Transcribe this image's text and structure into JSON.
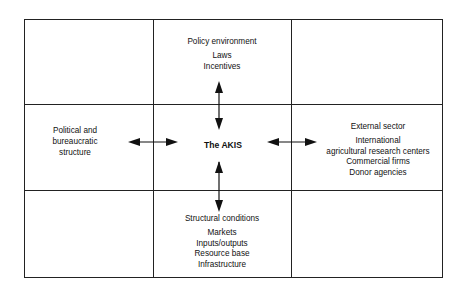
{
  "diagram": {
    "center": {
      "label": "The AKIS"
    },
    "top": {
      "title": "Policy environment",
      "items": [
        "Laws",
        "Incentives"
      ]
    },
    "left": {
      "lines": [
        "Political and",
        "bureaucratic",
        "structure"
      ]
    },
    "right": {
      "title": "External sector",
      "items": [
        "International",
        "agricultural research centers",
        "Commercial firms",
        "Donor agencies"
      ]
    },
    "bottom": {
      "title": "Structural conditions",
      "items": [
        "Markets",
        "Inputs/outputs",
        "Resource base",
        "Infrastructure"
      ]
    },
    "connections": [
      {
        "from": "The AKIS",
        "to": "Policy environment",
        "type": "bidirectional-arrow"
      },
      {
        "from": "The AKIS",
        "to": "Political and bureaucratic structure",
        "type": "bidirectional-arrow"
      },
      {
        "from": "The AKIS",
        "to": "External sector",
        "type": "bidirectional-arrow"
      },
      {
        "from": "The AKIS",
        "to": "Structural conditions",
        "type": "bidirectional-arrow"
      }
    ]
  }
}
